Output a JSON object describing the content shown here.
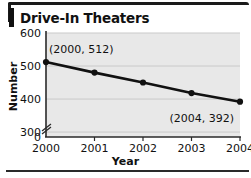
{
  "figure": {
    "title": "Drive-In Theaters",
    "frame_color": "#1a1a1a",
    "plot_bg_color": "#e8e8e8",
    "grid_color": "#c9c9c9",
    "series_color": "#111111"
  },
  "chart_data": {
    "type": "line",
    "title": "Drive-In Theaters",
    "xlabel": "Year",
    "ylabel": "Number",
    "categories": [
      "2000",
      "2001",
      "2002",
      "2003",
      "2004"
    ],
    "x": [
      2000,
      2001,
      2002,
      2003,
      2004
    ],
    "values": [
      512,
      480,
      450,
      418,
      392
    ],
    "series": [
      {
        "name": "Number of drive-in theaters",
        "values": [
          512,
          480,
          450,
          418,
          392
        ]
      }
    ],
    "xtick_labels": [
      "2000",
      "2001",
      "2002",
      "2003",
      "2004"
    ],
    "ytick_labels": [
      "600",
      "500",
      "400",
      "300",
      "0"
    ],
    "ytick_values": [
      600,
      500,
      400,
      300,
      0
    ],
    "ylim": [
      280,
      620
    ],
    "xlim": [
      2000,
      2004
    ],
    "axis_break": true,
    "axis_break_between": [
      0,
      300
    ],
    "grid": "horizontal",
    "legend": "none",
    "markers": "filled-circle",
    "annotations": [
      {
        "text": "(2000, 512)",
        "x": 2000,
        "y": 512,
        "position": "above-right"
      },
      {
        "text": "(2004, 392)",
        "x": 2004,
        "y": 392,
        "position": "below-left"
      }
    ]
  }
}
